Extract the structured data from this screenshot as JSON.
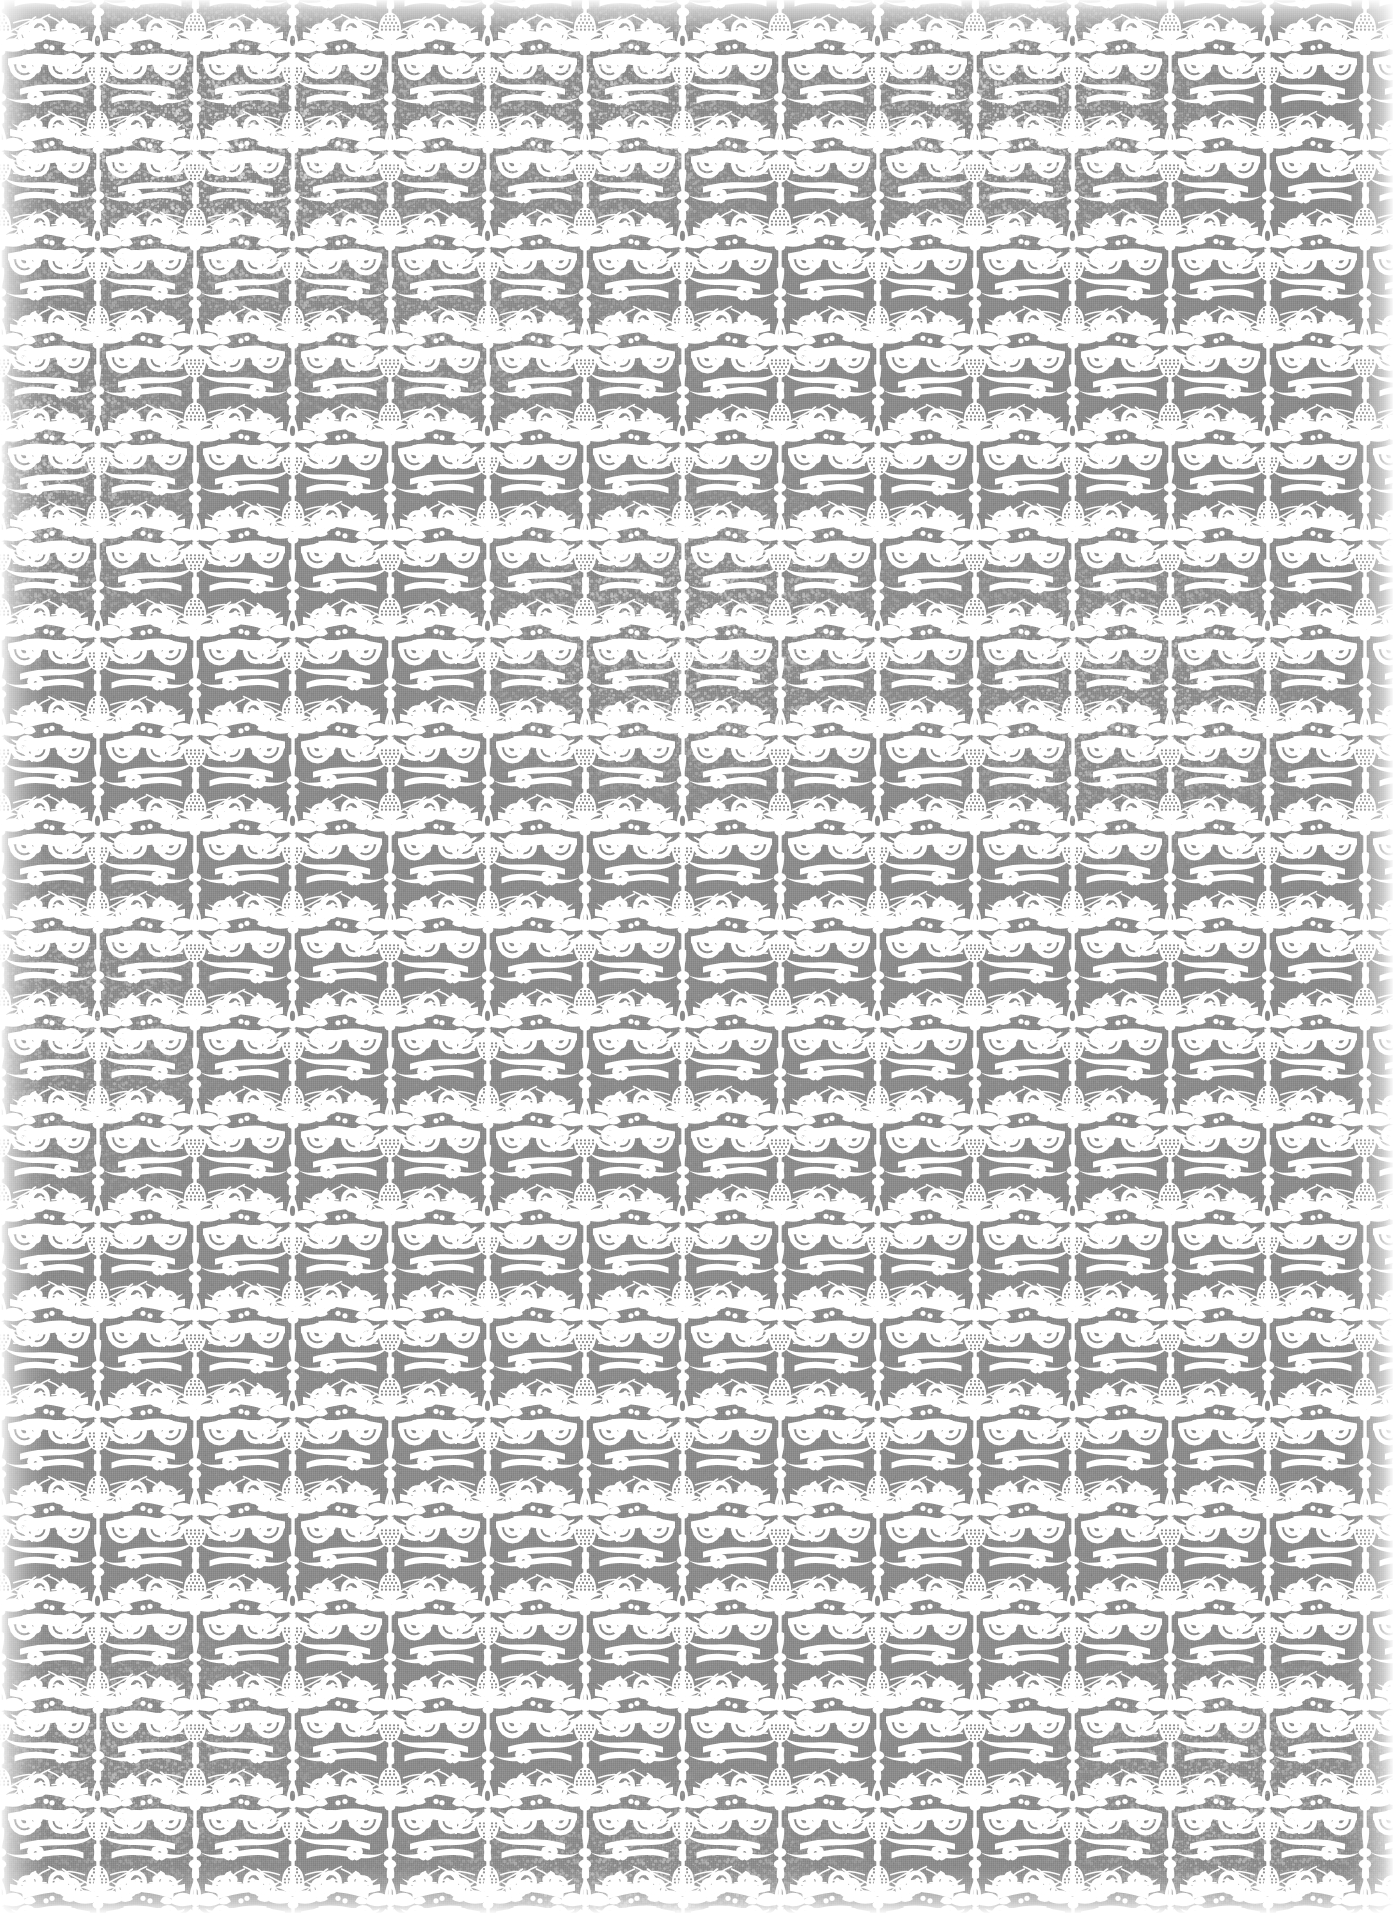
{
  "artwork": {
    "title": "Distressed Damask Wallpaper",
    "kind": "seamless-ornamental-pattern",
    "style": "vintage shabby-chic damask, worn / chalk-painted finish",
    "width": 1393,
    "height": 1913,
    "orientation": "portrait"
  },
  "palette": {
    "ground": "#8a8a8a",
    "ground_light": "#949494",
    "ground_dark": "#7e7e7e",
    "motif": "#ffffff",
    "motif_soft": "#f7f7f7",
    "edge_glow": "#ffffff"
  },
  "pattern": {
    "repeat_width": 195,
    "repeat_height": 195,
    "layout": "half-drop alternating columns",
    "column_phase_offset": 97.5,
    "columns_across": 7.1,
    "rows_down": 9.8,
    "symmetry": "vertical mirror about each column axis"
  },
  "motifs": [
    {
      "name": "bead-spine-column",
      "description": "slender vertical stem interrupted by turned beads, capped top and bottom by a stippled pineapple/thistle finial seated on a flared collar",
      "axis_role": "column A"
    },
    {
      "name": "fleur-de-lis-palmette",
      "description": "symmetric three-lobed palmette with a tall pointed finial spike above and a tapered drop below",
      "axis_role": "column B"
    },
    {
      "name": "c-scroll-pair",
      "description": "mirrored acanthus C-scrolls sweeping outward from each axis, terminating in tight volutes",
      "axis_role": "filler"
    },
    {
      "name": "five-petal-flower",
      "description": "small rosette of five rounded petals with a pierced centre, nested inside each scroll eye",
      "axis_role": "filler"
    },
    {
      "name": "stipple-dots",
      "description": "field of tiny dots texturing the pineapple finial cap",
      "axis_role": "detail"
    },
    {
      "name": "leaf-spray",
      "description": "fine radiating hairlines fanning from the palmette shoulders",
      "axis_role": "detail"
    }
  ],
  "distress": {
    "effect": "chalky white erosion blooms that bleach the grey ground and nibble the motif edges",
    "regions": [
      {
        "name": "upper-left-bloom",
        "cx": 215,
        "cy": 150,
        "rx": 300,
        "ry": 190,
        "strength": 0.8
      },
      {
        "name": "upper-centre-bloom",
        "cx": 600,
        "cy": 120,
        "rx": 250,
        "ry": 150,
        "strength": 0.62
      },
      {
        "name": "upper-right-bloom",
        "cx": 1010,
        "cy": 120,
        "rx": 270,
        "ry": 160,
        "strength": 0.7
      },
      {
        "name": "left-edge-wash",
        "cx": 60,
        "cy": 470,
        "rx": 165,
        "ry": 240,
        "strength": 0.55
      },
      {
        "name": "mid-centre-bloom",
        "cx": 690,
        "cy": 640,
        "rx": 290,
        "ry": 200,
        "strength": 0.58
      },
      {
        "name": "mid-right-bloom",
        "cx": 1130,
        "cy": 690,
        "rx": 260,
        "ry": 210,
        "strength": 0.5
      },
      {
        "name": "upper-band-streak",
        "cx": 430,
        "cy": 330,
        "rx": 330,
        "ry": 120,
        "strength": 0.42
      },
      {
        "name": "left-lower-wash",
        "cx": 95,
        "cy": 1020,
        "rx": 150,
        "ry": 220,
        "strength": 0.4
      },
      {
        "name": "lower-left-bloom",
        "cx": 140,
        "cy": 1760,
        "rx": 220,
        "ry": 165,
        "strength": 0.45
      },
      {
        "name": "lower-right-bloom",
        "cx": 1230,
        "cy": 1790,
        "rx": 230,
        "ry": 170,
        "strength": 0.48
      },
      {
        "name": "bottom-centre-wash",
        "cx": 640,
        "cy": 1870,
        "rx": 300,
        "ry": 110,
        "strength": 0.38
      }
    ]
  },
  "vignette": {
    "description": "soft white glow bleeding in from every edge of the scan",
    "edges": [
      "left",
      "right",
      "top",
      "bottom"
    ],
    "falloff_px": 46
  }
}
